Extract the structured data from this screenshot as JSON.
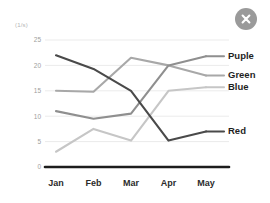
{
  "dialog": {
    "close_label": "close-icon",
    "close_color": "#9a9a9a"
  },
  "chart_data": {
    "type": "line",
    "title": "",
    "subtitle": "",
    "xlabel": "",
    "ylabel": "(1/s)",
    "unit_label": "(1/s)",
    "categories": [
      "Jan",
      "Feb",
      "Mar",
      "Apr",
      "May"
    ],
    "x_tick_labels": [
      "Jan",
      "Feb",
      "Mar",
      "Apr",
      "May"
    ],
    "y_tick_labels": [
      "0",
      "5",
      "10",
      "15",
      "20",
      "25"
    ],
    "y_tick_values": [
      0,
      5,
      10,
      15,
      20,
      25
    ],
    "ylim": [
      0,
      25
    ],
    "grid": true,
    "grid_axis": "y",
    "legend_position": "right",
    "series": [
      {
        "name": "Puple",
        "color": "#8f8f8f",
        "values": [
          11,
          9.5,
          10.5,
          20,
          21.8
        ]
      },
      {
        "name": "Green",
        "color": "#a8a8a8",
        "values": [
          15,
          14.8,
          21.5,
          20,
          18
        ]
      },
      {
        "name": "Blue",
        "color": "#c6c6c6",
        "values": [
          3,
          7.5,
          5.2,
          15,
          15.7
        ]
      },
      {
        "name": "Red",
        "color": "#4a4a4a",
        "values": [
          22,
          19.3,
          15,
          5.2,
          7
        ]
      }
    ],
    "legend": [
      {
        "label": "Puple",
        "color": "#8f8f8f"
      },
      {
        "label": "Green",
        "color": "#a8a8a8"
      },
      {
        "label": "Blue",
        "color": "#c6c6c6"
      },
      {
        "label": "Red",
        "color": "#4a4a4a"
      }
    ]
  }
}
